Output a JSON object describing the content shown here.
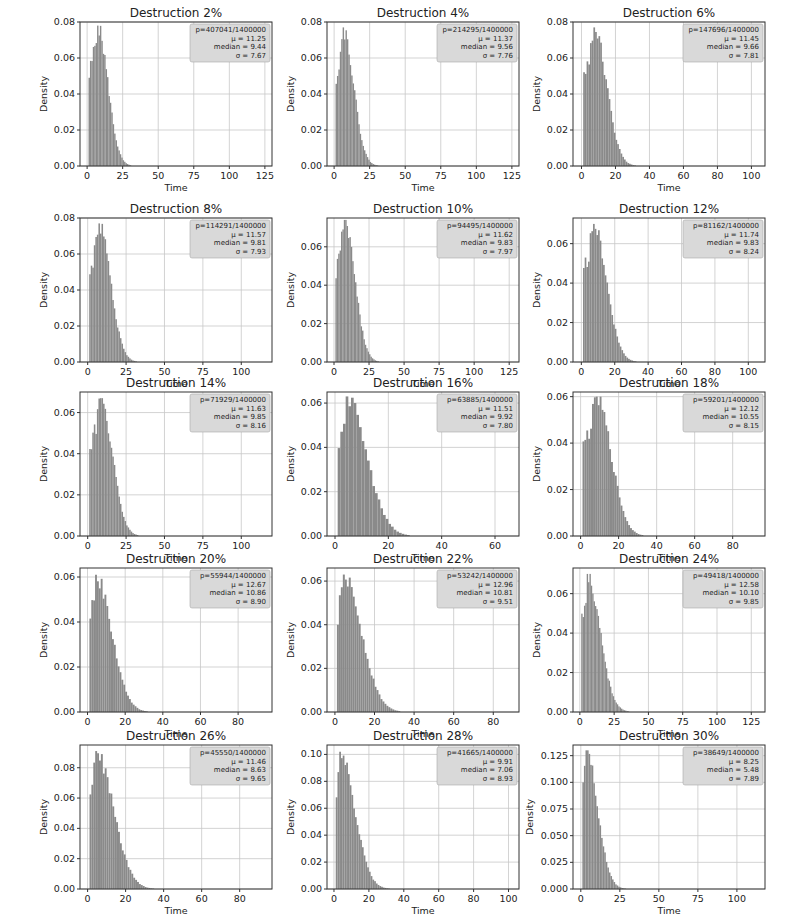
{
  "figure": {
    "bar_color": "#8a8a8a",
    "grid_color": "#c8c8c8",
    "legend_bg": "#d9d9d9"
  },
  "chart_data": [
    {
      "type": "bar",
      "title": "Destruction 2%",
      "xlabel": "Time",
      "ylabel": "Density",
      "xlim": [
        -5,
        130
      ],
      "ylim": [
        0,
        0.08
      ],
      "xticks": [
        "0",
        "25",
        "50",
        "75",
        "100",
        "125"
      ],
      "xtick_vals": [
        0,
        25,
        50,
        75,
        100,
        125
      ],
      "yticks": [
        "0.00",
        "0.02",
        "0.04",
        "0.06",
        "0.08"
      ],
      "ytick_vals": [
        0,
        0.02,
        0.04,
        0.06,
        0.08
      ],
      "legend": {
        "p": "p=407041/1400000",
        "mu": "μ = 11.25",
        "median": "median = 9.44",
        "sigma": "σ = 7.67"
      },
      "mu": 11.25,
      "median": 9.44,
      "sigma": 7.67,
      "peak": 0.078,
      "peak_x": 7,
      "grid": true
    },
    {
      "type": "bar",
      "title": "Destruction 4%",
      "xlabel": "Time",
      "ylabel": "Density",
      "xlim": [
        -5,
        130
      ],
      "ylim": [
        0,
        0.08
      ],
      "xticks": [
        "0",
        "25",
        "50",
        "75",
        "100",
        "125"
      ],
      "xtick_vals": [
        0,
        25,
        50,
        75,
        100,
        125
      ],
      "yticks": [
        "0.00",
        "0.02",
        "0.04",
        "0.06",
        "0.08"
      ],
      "ytick_vals": [
        0,
        0.02,
        0.04,
        0.06,
        0.08
      ],
      "legend": {
        "p": "p=214295/1400000",
        "mu": "μ = 11.37",
        "median": "median = 9.56",
        "sigma": "σ = 7.76"
      },
      "mu": 11.37,
      "median": 9.56,
      "sigma": 7.76,
      "peak": 0.077,
      "peak_x": 6,
      "grid": true
    },
    {
      "type": "bar",
      "title": "Destruction 6%",
      "xlabel": "Time",
      "ylabel": "Density",
      "xlim": [
        -5,
        108
      ],
      "ylim": [
        0,
        0.08
      ],
      "xticks": [
        "0",
        "20",
        "40",
        "60",
        "80",
        "100"
      ],
      "xtick_vals": [
        0,
        20,
        40,
        60,
        80,
        100
      ],
      "yticks": [
        "0.00",
        "0.02",
        "0.04",
        "0.06",
        "0.08"
      ],
      "ytick_vals": [
        0,
        0.02,
        0.04,
        0.06,
        0.08
      ],
      "legend": {
        "p": "p=147696/1400000",
        "mu": "μ = 11.45",
        "median": "median = 9.66",
        "sigma": "σ = 7.81"
      },
      "mu": 11.45,
      "median": 9.66,
      "sigma": 7.81,
      "peak": 0.077,
      "peak_x": 7,
      "grid": true
    },
    {
      "type": "bar",
      "title": "Destruction 8%",
      "xlabel": "Time",
      "ylabel": "Density",
      "xlim": [
        -5,
        120
      ],
      "ylim": [
        0,
        0.08
      ],
      "xticks": [
        "0",
        "25",
        "50",
        "75",
        "100"
      ],
      "xtick_vals": [
        0,
        25,
        50,
        75,
        100
      ],
      "yticks": [
        "0.00",
        "0.02",
        "0.04",
        "0.06",
        "0.08"
      ],
      "ytick_vals": [
        0,
        0.02,
        0.04,
        0.06,
        0.08
      ],
      "legend": {
        "p": "p=114291/1400000",
        "mu": "μ = 11.57",
        "median": "median = 9.81",
        "sigma": "σ = 7.93"
      },
      "mu": 11.57,
      "median": 9.81,
      "sigma": 7.93,
      "peak": 0.077,
      "peak_x": 7,
      "grid": true
    },
    {
      "type": "bar",
      "title": "Destruction 10%",
      "xlabel": "Time",
      "ylabel": "Density",
      "xlim": [
        -5,
        132
      ],
      "ylim": [
        0,
        0.075
      ],
      "xticks": [
        "0",
        "25",
        "50",
        "75",
        "100",
        "125"
      ],
      "xtick_vals": [
        0,
        25,
        50,
        75,
        100,
        125
      ],
      "yticks": [
        "0.00",
        "0.02",
        "0.04",
        "0.06"
      ],
      "ytick_vals": [
        0,
        0.02,
        0.04,
        0.06
      ],
      "legend": {
        "p": "p=94495/1400000",
        "mu": "μ = 11.62",
        "median": "median = 9.83",
        "sigma": "σ = 7.97"
      },
      "mu": 11.62,
      "median": 9.83,
      "sigma": 7.97,
      "peak": 0.074,
      "peak_x": 7,
      "grid": true
    },
    {
      "type": "bar",
      "title": "Destruction 12%",
      "xlabel": "Time",
      "ylabel": "Density",
      "xlim": [
        -5,
        110
      ],
      "ylim": [
        0,
        0.073
      ],
      "xticks": [
        "0",
        "20",
        "40",
        "60",
        "80",
        "100"
      ],
      "xtick_vals": [
        0,
        20,
        40,
        60,
        80,
        100
      ],
      "yticks": [
        "0.00",
        "0.02",
        "0.04",
        "0.06"
      ],
      "ytick_vals": [
        0,
        0.02,
        0.04,
        0.06
      ],
      "legend": {
        "p": "p=81162/1400000",
        "mu": "μ = 11.74",
        "median": "median = 9.83",
        "sigma": "σ = 8.24"
      },
      "mu": 11.74,
      "median": 9.83,
      "sigma": 8.24,
      "peak": 0.07,
      "peak_x": 7,
      "grid": true
    },
    {
      "type": "bar",
      "title": "Destruction 14%",
      "xlabel": "Time",
      "ylabel": "Density",
      "xlim": [
        -5,
        120
      ],
      "ylim": [
        0,
        0.07
      ],
      "xticks": [
        "0",
        "25",
        "50",
        "75",
        "100"
      ],
      "xtick_vals": [
        0,
        25,
        50,
        75,
        100
      ],
      "yticks": [
        "0.00",
        "0.02",
        "0.04",
        "0.06"
      ],
      "ytick_vals": [
        0,
        0.02,
        0.04,
        0.06
      ],
      "legend": {
        "p": "p=71929/1400000",
        "mu": "μ = 11.63",
        "median": "median = 9.85",
        "sigma": "σ = 8.16"
      },
      "mu": 11.63,
      "median": 9.85,
      "sigma": 8.16,
      "peak": 0.067,
      "peak_x": 8,
      "grid": true
    },
    {
      "type": "bar",
      "title": "Destruction 16%",
      "xlabel": "Time",
      "ylabel": "Density",
      "xlim": [
        -3,
        69
      ],
      "ylim": [
        0,
        0.065
      ],
      "xticks": [
        "0",
        "20",
        "40",
        "60"
      ],
      "xtick_vals": [
        0,
        20,
        40,
        60
      ],
      "yticks": [
        "0.00",
        "0.02",
        "0.04",
        "0.06"
      ],
      "ytick_vals": [
        0,
        0.02,
        0.04,
        0.06
      ],
      "legend": {
        "p": "p=63885/1400000",
        "mu": "μ = 11.51",
        "median": "median = 9.92",
        "sigma": "σ = 7.80"
      },
      "mu": 11.51,
      "median": 9.92,
      "sigma": 7.8,
      "peak": 0.063,
      "peak_x": 4,
      "grid": true
    },
    {
      "type": "bar",
      "title": "Destruction 18%",
      "xlabel": "Time",
      "ylabel": "Density",
      "xlim": [
        -4,
        97
      ],
      "ylim": [
        0,
        0.062
      ],
      "xticks": [
        "0",
        "20",
        "40",
        "60",
        "80"
      ],
      "xtick_vals": [
        0,
        20,
        40,
        60,
        80
      ],
      "yticks": [
        "0.00",
        "0.02",
        "0.04",
        "0.06"
      ],
      "ytick_vals": [
        0,
        0.02,
        0.04,
        0.06
      ],
      "legend": {
        "p": "p=59201/1400000",
        "mu": "μ = 12.12",
        "median": "median = 10.55",
        "sigma": "σ = 8.15"
      },
      "mu": 12.12,
      "median": 10.55,
      "sigma": 8.15,
      "peak": 0.06,
      "peak_x": 8,
      "grid": true
    },
    {
      "type": "bar",
      "title": "Destruction 20%",
      "xlabel": "Time",
      "ylabel": "Density",
      "xlim": [
        -4,
        98
      ],
      "ylim": [
        0,
        0.064
      ],
      "xticks": [
        "0",
        "20",
        "40",
        "60",
        "80"
      ],
      "xtick_vals": [
        0,
        20,
        40,
        60,
        80
      ],
      "yticks": [
        "0.00",
        "0.02",
        "0.04",
        "0.06"
      ],
      "ytick_vals": [
        0,
        0.02,
        0.04,
        0.06
      ],
      "legend": {
        "p": "p=55944/1400000",
        "mu": "μ = 12.67",
        "median": "median = 10.86",
        "sigma": "σ = 8.90"
      },
      "mu": 12.67,
      "median": 10.86,
      "sigma": 8.9,
      "peak": 0.061,
      "peak_x": 4,
      "grid": true
    },
    {
      "type": "bar",
      "title": "Destruction 22%",
      "xlabel": "Time",
      "ylabel": "Density",
      "xlim": [
        -4,
        93
      ],
      "ylim": [
        0,
        0.066
      ],
      "xticks": [
        "0",
        "20",
        "40",
        "60",
        "80"
      ],
      "xtick_vals": [
        0,
        20,
        40,
        60,
        80
      ],
      "yticks": [
        "0.00",
        "0.02",
        "0.04",
        "0.06"
      ],
      "ytick_vals": [
        0,
        0.02,
        0.04,
        0.06
      ],
      "legend": {
        "p": "p=53242/1400000",
        "mu": "μ = 12.96",
        "median": "median = 10.81",
        "sigma": "σ = 9.51"
      },
      "mu": 12.96,
      "median": 10.81,
      "sigma": 9.51,
      "peak": 0.063,
      "peak_x": 4,
      "grid": true
    },
    {
      "type": "bar",
      "title": "Destruction 24%",
      "xlabel": "Time",
      "ylabel": "Density",
      "xlim": [
        -5,
        135
      ],
      "ylim": [
        0,
        0.073
      ],
      "xticks": [
        "0",
        "25",
        "50",
        "75",
        "100",
        "125"
      ],
      "xtick_vals": [
        0,
        25,
        50,
        75,
        100,
        125
      ],
      "yticks": [
        "0.00",
        "0.02",
        "0.04",
        "0.06"
      ],
      "ytick_vals": [
        0,
        0.02,
        0.04,
        0.06
      ],
      "legend": {
        "p": "p=49418/1400000",
        "mu": "μ = 12.58",
        "median": "median = 10.10",
        "sigma": "σ = 9.85"
      },
      "mu": 12.58,
      "median": 10.1,
      "sigma": 9.85,
      "peak": 0.07,
      "peak_x": 5,
      "grid": true
    },
    {
      "type": "bar",
      "title": "Destruction 26%",
      "xlabel": "Time",
      "ylabel": "Density",
      "xlim": [
        -4,
        97
      ],
      "ylim": [
        0,
        0.095
      ],
      "xticks": [
        "0",
        "20",
        "40",
        "60",
        "80"
      ],
      "xtick_vals": [
        0,
        20,
        40,
        60,
        80
      ],
      "yticks": [
        "0.00",
        "0.02",
        "0.04",
        "0.06",
        "0.08"
      ],
      "ytick_vals": [
        0,
        0.02,
        0.04,
        0.06,
        0.08
      ],
      "legend": {
        "p": "p=45550/1400000",
        "mu": "μ = 11.46",
        "median": "median = 8.63",
        "sigma": "σ = 9.65"
      },
      "mu": 11.46,
      "median": 8.63,
      "sigma": 9.65,
      "peak": 0.091,
      "peak_x": 4,
      "grid": true
    },
    {
      "type": "bar",
      "title": "Destruction 28%",
      "xlabel": "Time",
      "ylabel": "Density",
      "xlim": [
        -4,
        106
      ],
      "ylim": [
        0,
        0.107
      ],
      "xticks": [
        "0",
        "20",
        "40",
        "60",
        "80",
        "100"
      ],
      "xtick_vals": [
        0,
        20,
        40,
        60,
        80,
        100
      ],
      "yticks": [
        "0.00",
        "0.02",
        "0.04",
        "0.06",
        "0.08",
        "0.10"
      ],
      "ytick_vals": [
        0,
        0.02,
        0.04,
        0.06,
        0.08,
        0.1
      ],
      "legend": {
        "p": "p=41665/1400000",
        "mu": "μ = 9.91",
        "median": "median = 7.06",
        "sigma": "σ = 8.93"
      },
      "mu": 9.91,
      "median": 7.06,
      "sigma": 8.93,
      "peak": 0.102,
      "peak_x": 3,
      "grid": true
    },
    {
      "type": "bar",
      "title": "Destruction 30%",
      "xlabel": "Time",
      "ylabel": "Density",
      "xlim": [
        -5,
        118
      ],
      "ylim": [
        0,
        0.135
      ],
      "xticks": [
        "0",
        "25",
        "50",
        "75",
        "100"
      ],
      "xtick_vals": [
        0,
        25,
        50,
        75,
        100
      ],
      "yticks": [
        "0.000",
        "0.025",
        "0.050",
        "0.075",
        "0.100",
        "0.125"
      ],
      "ytick_vals": [
        0,
        0.025,
        0.05,
        0.075,
        0.1,
        0.125
      ],
      "legend": {
        "p": "p=38649/1400000",
        "mu": "μ = 8.25",
        "median": "median = 5.48",
        "sigma": "σ = 7.89"
      },
      "mu": 8.25,
      "median": 5.48,
      "sigma": 7.89,
      "peak": 0.13,
      "peak_x": 3,
      "grid": true
    }
  ]
}
